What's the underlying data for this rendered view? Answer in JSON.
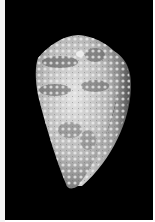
{
  "image": {
    "subject": "cone shell",
    "alt": "Photograph of a mottled cone seashell on a black background",
    "background_color": "#000000",
    "border_color": "#f4f4f4",
    "shell_colors": {
      "base": "#c9c9c9",
      "highlight": "#e6e6e6",
      "spots": "#5a5a5a",
      "lip": "#b5b5b5"
    }
  }
}
